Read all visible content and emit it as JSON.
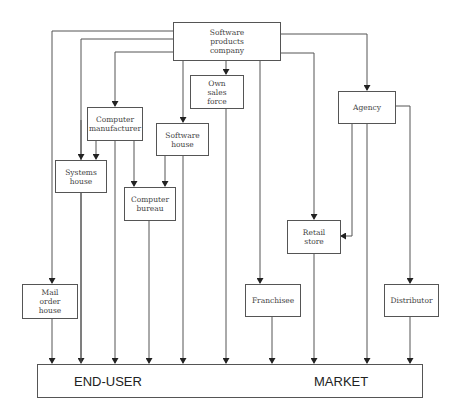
{
  "diagram": {
    "type": "distribution-channel-flowchart",
    "colors": {
      "line": "#555555",
      "text": "#333333",
      "background": "#ffffff"
    },
    "nodes": {
      "software_company": "Software\nproducts\ncompany",
      "own_sales_force": "Own\nsales\nforce",
      "computer_manufacturer": "Computer\nmanufacturer",
      "software_house": "Software\nhouse",
      "systems_house": "Systems\nhouse",
      "computer_bureau": "Computer\nbureau",
      "agency": "Agency",
      "retail_store": "Retail\nstore",
      "mail_order_house": "Mail\norder\nhouse",
      "franchisee": "Franchisee",
      "distributor": "Distributor"
    },
    "market": {
      "left_label": "END-USER",
      "right_label": "MARKET"
    },
    "edges": [
      [
        "Software products company",
        "Mail order house"
      ],
      [
        "Software products company",
        "END-USER MARKET"
      ],
      [
        "Software products company",
        "Systems house"
      ],
      [
        "Software products company",
        "Computer manufacturer"
      ],
      [
        "Software products company",
        "Software house"
      ],
      [
        "Software products company",
        "Own sales force"
      ],
      [
        "Software products company",
        "Franchisee"
      ],
      [
        "Software products company",
        "Retail store"
      ],
      [
        "Software products company",
        "Agency"
      ],
      [
        "Computer manufacturer",
        "Systems house"
      ],
      [
        "Computer manufacturer",
        "Computer bureau"
      ],
      [
        "Computer manufacturer",
        "END-USER MARKET"
      ],
      [
        "Software house",
        "Computer bureau"
      ],
      [
        "Software house",
        "END-USER MARKET"
      ],
      [
        "Own sales force",
        "END-USER MARKET"
      ],
      [
        "Systems house",
        "END-USER MARKET"
      ],
      [
        "Computer bureau",
        "END-USER MARKET"
      ],
      [
        "Agency",
        "Retail store"
      ],
      [
        "Agency",
        "END-USER MARKET"
      ],
      [
        "Agency",
        "Distributor"
      ],
      [
        "Retail store",
        "END-USER MARKET"
      ],
      [
        "Mail order house",
        "END-USER MARKET"
      ],
      [
        "Franchisee",
        "END-USER MARKET"
      ],
      [
        "Distributor",
        "END-USER MARKET"
      ]
    ]
  }
}
